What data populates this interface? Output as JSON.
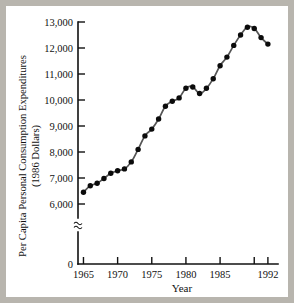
{
  "figure": {
    "background_color": "#ffffff",
    "page_border_color": "#b8b5ae",
    "axis_color": "#111111",
    "line_color": "#555555",
    "marker_color": "#0b0b0b",
    "axis_break_symbol": "≈"
  },
  "chart_data": {
    "type": "line",
    "title": "",
    "xlabel": "Year",
    "ylabel": "Per Capita Personal Consumption Expenditures (1986 Dollars)",
    "ylabel_line1": "Per Capita Personal Consumption Expenditures",
    "ylabel_line2": "(1986 Dollars)",
    "x": [
      1965,
      1966,
      1967,
      1968,
      1969,
      1970,
      1971,
      1972,
      1973,
      1974,
      1975,
      1976,
      1977,
      1978,
      1979,
      1980,
      1981,
      1982,
      1983,
      1984,
      1985,
      1986,
      1987,
      1988,
      1989,
      1990,
      1991,
      1992
    ],
    "values": [
      6450,
      6700,
      6800,
      6980,
      7180,
      7280,
      7350,
      7620,
      8100,
      8620,
      8880,
      9270,
      9760,
      9950,
      10080,
      10450,
      10500,
      10250,
      10450,
      10820,
      11320,
      11650,
      12100,
      12500,
      12800,
      12750,
      12400,
      12150
    ],
    "xlim": [
      1964.2,
      1992.6
    ],
    "ylim": [
      5850,
      13000
    ],
    "y_ticks": [
      6000,
      7000,
      8000,
      9000,
      10000,
      11000,
      12000,
      13000
    ],
    "y_tick_labels": [
      "6,000",
      "7,000",
      "8,000",
      "9,000",
      "10,000",
      "11,000",
      "12,000",
      "13,000"
    ],
    "y_origin_label": "0",
    "x_ticks": [
      1965,
      1970,
      1975,
      1980,
      1985,
      1990,
      1992
    ],
    "x_tick_labels": [
      "1965",
      "1970",
      "1975",
      "1980",
      "1985",
      "",
      "1992"
    ],
    "grid": false,
    "legend": null,
    "axis_break": true,
    "marker": "filled-circle"
  }
}
